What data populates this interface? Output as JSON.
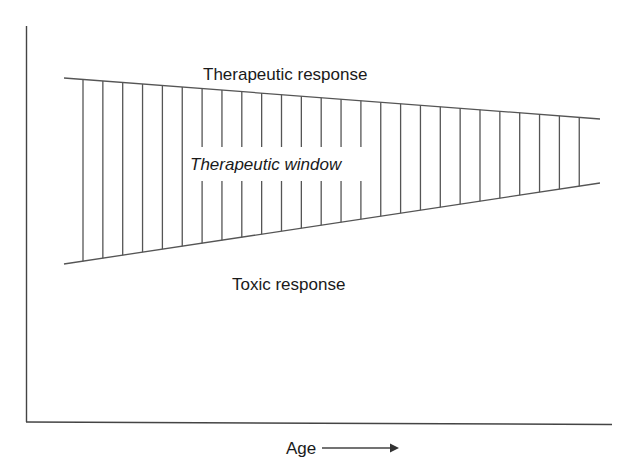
{
  "diagram": {
    "title": "",
    "labels": {
      "upper": "Therapeutic response",
      "window": "Therapeutic window",
      "lower": "Toxic response",
      "x_axis": "Age"
    },
    "colors": {
      "line": "#555555",
      "axis": "#444444",
      "text": "#1a1a1a",
      "background": "#ffffff"
    },
    "band": {
      "top_line": {
        "from": [
          64,
          78
        ],
        "to": [
          600,
          119
        ]
      },
      "bottom_line": {
        "from": [
          64,
          264
        ],
        "to": [
          600,
          183
        ]
      },
      "hatch_count": 26,
      "hatch_start_x": 83,
      "hatch_spacing": 19.85
    }
  }
}
